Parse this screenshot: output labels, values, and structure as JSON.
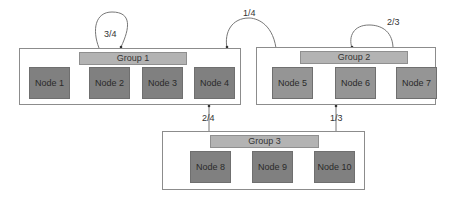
{
  "groups": [
    {
      "label": "Group 1",
      "nodes": [
        "Node 1",
        "Node 2",
        "Node 3",
        "Node 4"
      ]
    },
    {
      "label": "Group 2",
      "nodes": [
        "Node 5",
        "Node 6",
        "Node 7"
      ]
    },
    {
      "label": "Group 3",
      "nodes": [
        "Node 8",
        "Node 9",
        "Node 10"
      ]
    }
  ],
  "edges": [
    {
      "from": "Group 1",
      "to": "Group 1",
      "label": "3/4"
    },
    {
      "from": "Group 2",
      "to": "Group 1",
      "label": "1/4"
    },
    {
      "from": "Group 2",
      "to": "Group 2",
      "label": "2/3"
    },
    {
      "from": "Group 3",
      "to": "Group 1",
      "label": "2/4"
    },
    {
      "from": "Group 3",
      "to": "Group 2",
      "label": "1/3"
    }
  ],
  "colors": {
    "group1_node": "#808080",
    "group2_node": "#959595",
    "group3_node": "#808080",
    "group_label_bg": "#b3b3b3",
    "border": "#8c8c8c"
  }
}
